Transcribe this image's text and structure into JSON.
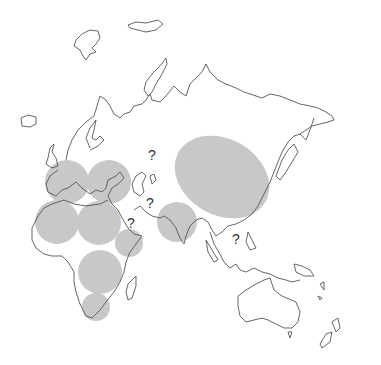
{
  "map": {
    "title": "",
    "region_fill": "#c8c8c8",
    "outline_color": "#555555",
    "question_mark": "?",
    "regions": [
      {
        "name": "Western Europe",
        "shape": "circle",
        "cx": 67,
        "cy": 182,
        "r": 22
      },
      {
        "name": "Eastern Mediterranean",
        "shape": "circle",
        "cx": 109,
        "cy": 182,
        "r": 22
      },
      {
        "name": "Northwest Africa",
        "shape": "circle",
        "cx": 57,
        "cy": 222,
        "r": 22
      },
      {
        "name": "Northeast Africa",
        "shape": "circle",
        "cx": 99,
        "cy": 223,
        "r": 22
      },
      {
        "name": "Horn of Africa",
        "shape": "circle",
        "cx": 129,
        "cy": 243,
        "r": 14
      },
      {
        "name": "Central Africa",
        "shape": "circle",
        "cx": 100,
        "cy": 272,
        "r": 22
      },
      {
        "name": "Southern Africa",
        "shape": "circle",
        "cx": 96,
        "cy": 307,
        "r": 14
      },
      {
        "name": "South Asia",
        "shape": "circle",
        "cx": 177,
        "cy": 222,
        "r": 20
      },
      {
        "name": "East Asia",
        "shape": "ellipse",
        "cx": 222,
        "cy": 177,
        "rx": 50,
        "ry": 38,
        "rotate": 30
      }
    ],
    "unknowns": [
      {
        "x": 148,
        "y": 160
      },
      {
        "x": 146,
        "y": 208
      },
      {
        "x": 127,
        "y": 228
      },
      {
        "x": 232,
        "y": 244
      }
    ]
  }
}
